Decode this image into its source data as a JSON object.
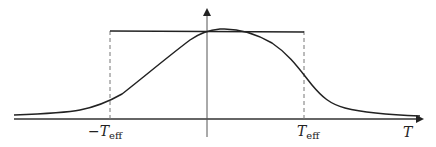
{
  "diagram": {
    "type": "gaussian-like pulse with effective-width rectangle",
    "axes": {
      "x_label": "T",
      "y_arrow": true
    },
    "labels": {
      "neg_teff": {
        "main": "−T",
        "sub": "eff"
      },
      "pos_teff": {
        "main": "T",
        "sub": "eff"
      },
      "x_axis": "T"
    },
    "colors": {
      "curve": "#222222",
      "axis": "#333333",
      "dashed": "#777777"
    }
  }
}
